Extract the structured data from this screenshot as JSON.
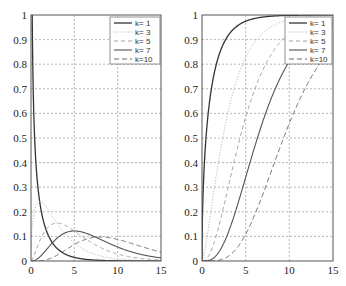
{
  "figure": {
    "background": "#ffffff",
    "axis_color": "#555555",
    "grid_color": "#9a9a9a"
  },
  "chart_data": [
    {
      "type": "line",
      "title": "",
      "xlabel": "",
      "ylabel": "",
      "description": "Chi-square probability density functions",
      "xlim": [
        0,
        15
      ],
      "ylim": [
        0,
        1
      ],
      "grid": true,
      "legend_position": "upper right",
      "xticks": [
        "0",
        "5",
        "10",
        "15"
      ],
      "yticks": [
        "0",
        "0.1",
        "0.2",
        "0.3",
        "0.4",
        "0.5",
        "0.6",
        "0.7",
        "0.8",
        "0.9",
        "1"
      ],
      "x": [
        0,
        1,
        2,
        3,
        4,
        5,
        6,
        7,
        8,
        9,
        10,
        11,
        12,
        13,
        14,
        15
      ],
      "series": [
        {
          "name": "k= 1",
          "k": 1,
          "style": "solid",
          "color": "#333333",
          "width": 1.3,
          "values": [
            1.0,
            0.242,
            0.104,
            0.051,
            0.027,
            0.015,
            0.008,
            0.0045,
            0.0026,
            0.0015,
            0.00085,
            0.0005,
            0.0003,
            0.00018,
            0.0001,
            6e-05
          ]
        },
        {
          "name": "k= 3",
          "k": 3,
          "style": "dotted",
          "color": "#b8b8b8",
          "width": 1.0,
          "values": [
            0,
            0.242,
            0.208,
            0.154,
            0.108,
            0.073,
            0.048,
            0.032,
            0.021,
            0.013,
            0.0085,
            0.0054,
            0.0035,
            0.0022,
            0.0014,
            0.0009
          ]
        },
        {
          "name": "k= 5",
          "k": 5,
          "style": "dashed",
          "color": "#a0a0a0",
          "width": 1.0,
          "values": [
            0,
            0.081,
            0.138,
            0.154,
            0.144,
            0.122,
            0.096,
            0.073,
            0.054,
            0.039,
            0.028,
            0.02,
            0.014,
            0.0096,
            0.0066,
            0.0045
          ]
        },
        {
          "name": "k= 7",
          "k": 7,
          "style": "solid",
          "color": "#555555",
          "width": 1.1,
          "values": [
            0,
            0.016,
            0.055,
            0.093,
            0.115,
            0.122,
            0.117,
            0.104,
            0.088,
            0.072,
            0.057,
            0.044,
            0.033,
            0.024,
            0.018,
            0.013
          ]
        },
        {
          "name": "k=10",
          "k": 10,
          "style": "longdash",
          "color": "#666666",
          "width": 1.0,
          "values": [
            0,
            0.0016,
            0.015,
            0.047,
            0.078,
            0.096,
            0.101,
            0.094,
            0.083,
            0.068,
            0.054,
            0.042,
            0.031,
            0.022,
            0.016,
            0.011
          ]
        }
      ]
    },
    {
      "type": "line",
      "title": "",
      "xlabel": "",
      "ylabel": "",
      "description": "Chi-square cumulative distribution functions",
      "xlim": [
        0,
        15
      ],
      "ylim": [
        0,
        1
      ],
      "grid": true,
      "legend_position": "upper right",
      "xticks": [
        "0",
        "5",
        "10",
        "15"
      ],
      "yticks": [
        "0",
        "0.1",
        "0.2",
        "0.3",
        "0.4",
        "0.5",
        "0.6",
        "0.7",
        "0.8",
        "0.9",
        "1"
      ],
      "x": [
        0,
        1,
        2,
        3,
        4,
        5,
        6,
        7,
        8,
        9,
        10,
        11,
        12,
        13,
        14,
        15
      ],
      "series": [
        {
          "name": "k= 1",
          "k": 1,
          "style": "solid",
          "color": "#333333",
          "width": 1.3,
          "values": [
            0,
            0.683,
            0.843,
            0.917,
            0.954,
            0.975,
            0.986,
            0.992,
            0.995,
            0.997,
            0.998,
            0.999,
            0.999,
            1.0,
            1.0,
            1.0
          ]
        },
        {
          "name": "k= 3",
          "k": 3,
          "style": "dotted",
          "color": "#b8b8b8",
          "width": 1.0,
          "values": [
            0,
            0.199,
            0.428,
            0.608,
            0.739,
            0.828,
            0.888,
            0.928,
            0.954,
            0.971,
            0.981,
            0.988,
            0.993,
            0.995,
            0.997,
            0.998
          ]
        },
        {
          "name": "k= 5",
          "k": 5,
          "style": "dashed",
          "color": "#a0a0a0",
          "width": 1.0,
          "values": [
            0,
            0.037,
            0.151,
            0.3,
            0.451,
            0.584,
            0.694,
            0.779,
            0.844,
            0.891,
            0.925,
            0.949,
            0.965,
            0.977,
            0.984,
            0.99
          ]
        },
        {
          "name": "k= 7",
          "k": 7,
          "style": "solid",
          "color": "#555555",
          "width": 1.1,
          "values": [
            0,
            0.006,
            0.04,
            0.115,
            0.22,
            0.34,
            0.46,
            0.571,
            0.667,
            0.747,
            0.812,
            0.862,
            0.899,
            0.928,
            0.949,
            0.964
          ]
        },
        {
          "name": "k=10",
          "k": 10,
          "style": "longdash",
          "color": "#666666",
          "width": 1.0,
          "values": [
            0,
            0.0002,
            0.004,
            0.019,
            0.053,
            0.109,
            0.185,
            0.275,
            0.371,
            0.468,
            0.56,
            0.643,
            0.715,
            0.777,
            0.827,
            0.868
          ]
        }
      ]
    }
  ],
  "panels": [
    {
      "id": "pdf",
      "left": 31,
      "top": 15,
      "right": 161,
      "bottom": 261,
      "legend": {
        "x": 110,
        "y": 17,
        "w": 50,
        "h": 47
      }
    },
    {
      "id": "cdf",
      "left": 202,
      "top": 15,
      "right": 333,
      "bottom": 261,
      "legend": {
        "x": 285,
        "y": 17,
        "w": 47,
        "h": 47
      }
    }
  ]
}
